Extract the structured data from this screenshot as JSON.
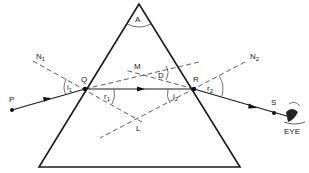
{
  "figure": {
    "type": "prism-refraction-diagram",
    "labels": {
      "apex_angle": "A",
      "normal_1": "N",
      "normal_1_sub": "1",
      "normal_2": "N",
      "normal_2_sub": "2",
      "incident_point": "Q",
      "emergent_point": "R",
      "source_point": "P",
      "exit_point": "S",
      "deviation_vertex": "M",
      "deviation_angle": "D",
      "normals_intersection": "L",
      "angle_i1": "i",
      "angle_i1_sub": "1",
      "angle_r1": "r",
      "angle_r1_sub": "1",
      "angle_i2": "i",
      "angle_i2_sub": "2",
      "angle_r2": "r",
      "angle_r2_sub": "2",
      "observer": "EYE"
    },
    "colors": {
      "line": "#1a1a1a",
      "background": "#ffffff"
    }
  }
}
